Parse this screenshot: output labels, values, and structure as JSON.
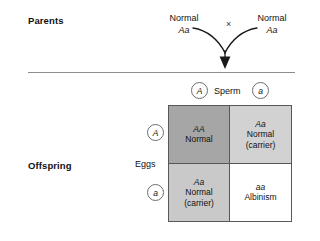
{
  "figure": {
    "type": "punnett-square-diagram",
    "topic": "Albinism inheritance — monohybrid cross of two carriers"
  },
  "sections": {
    "parents_label": "Parents",
    "offspring_label": "Offspring"
  },
  "parents": {
    "cross_symbol": "×",
    "mother": {
      "phenotype": "Normal",
      "genotype": "Aa"
    },
    "father": {
      "phenotype": "Normal",
      "genotype": "Aa"
    }
  },
  "gametes": {
    "sperm_label": "Sperm",
    "eggs_label": "Eggs",
    "sperm_alleles": [
      "A",
      "a"
    ],
    "egg_alleles": [
      "A",
      "a"
    ]
  },
  "punnett": {
    "cells": [
      {
        "genotype": "AA",
        "phenotype": "Normal",
        "note": ""
      },
      {
        "genotype": "Aa",
        "phenotype": "Normal",
        "note": "(carrier)"
      },
      {
        "genotype": "Aa",
        "phenotype": "Normal",
        "note": "(carrier)"
      },
      {
        "genotype": "aa",
        "phenotype": "Albinism",
        "note": ""
      }
    ]
  },
  "colors": {
    "cell_dark_gray": "#a6a6a6",
    "cell_light_gray": "#d2d2d2",
    "cell_mid_gray": "#c9c9c9",
    "cell_white": "#ffffff",
    "border_gray": "#58585a",
    "divider_gray": "#8d8d8d",
    "text": "#111111"
  }
}
